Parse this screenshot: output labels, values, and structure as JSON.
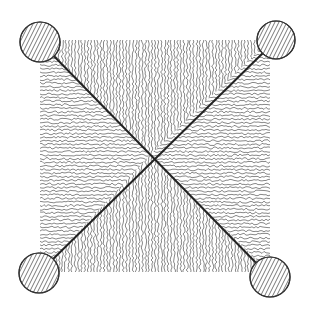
{
  "figure": {
    "caption": "",
    "colors": {
      "background": "#ffffff",
      "ink": "#333333",
      "hatch": "#555555"
    },
    "seat": {
      "x": 40,
      "y": 40,
      "w": 230,
      "h": 233
    },
    "posts": [
      {
        "name": "top-left",
        "cx": 40,
        "cy": 42,
        "r": 20
      },
      {
        "name": "top-right",
        "cx": 276,
        "cy": 40,
        "r": 19
      },
      {
        "name": "bottom-left",
        "cx": 39,
        "cy": 273,
        "r": 20
      },
      {
        "name": "bottom-right",
        "cx": 270,
        "cy": 277,
        "r": 20
      }
    ],
    "center": {
      "x": 150,
      "y": 155
    }
  }
}
